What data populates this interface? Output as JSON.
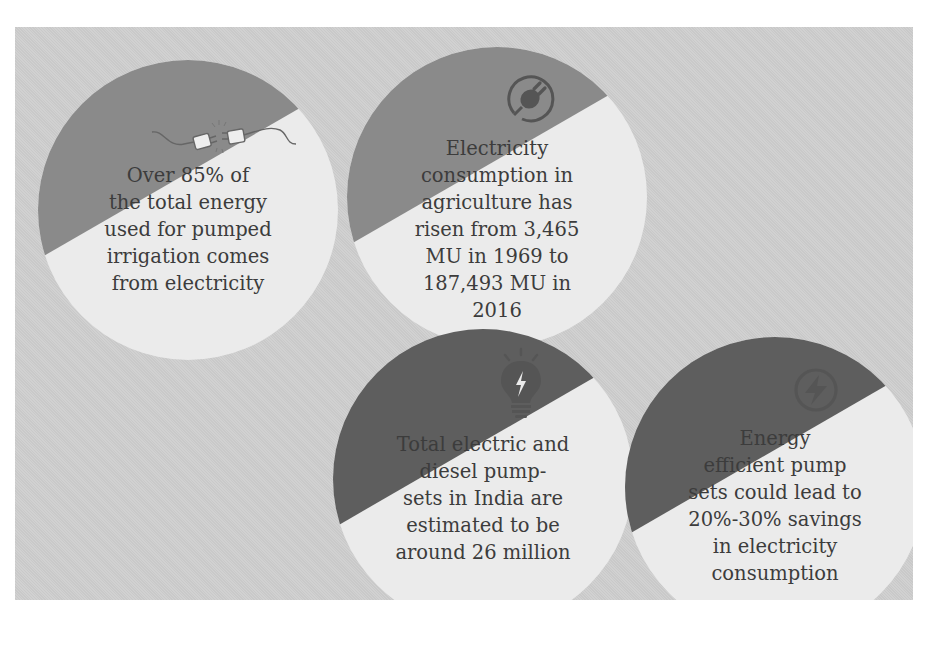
{
  "infographic": {
    "cards": [
      {
        "icon": "plug-disconnect-icon",
        "lines": [
          "Over 85% of",
          "the total energy",
          "used for pumped",
          "irrigation comes",
          "from electricity"
        ]
      },
      {
        "icon": "plug-circle-icon",
        "lines": [
          "Electricity",
          "consumption in",
          "agriculture has",
          "risen from 3,465",
          "MU in 1969 to",
          "187,493 MU in",
          "2016"
        ]
      },
      {
        "icon": "lightbulb-bolt-icon",
        "lines": [
          "Total electric and",
          "diesel pump-",
          "sets in India are",
          "estimated to be",
          "around 26 million"
        ]
      },
      {
        "icon": "lightning-circle-icon",
        "lines": [
          "Energy",
          "efficient pump",
          "sets could lead to",
          "20%-30% savings",
          "in electricity",
          "consumption"
        ]
      }
    ],
    "colors": {
      "panel_bg": "#cfcfcf",
      "circle_fill": "#ebebeb",
      "band_light": "#8a8a8a",
      "band_dark": "#5e5e5e",
      "text": "#3c3c3c",
      "icon": "#555555"
    }
  }
}
